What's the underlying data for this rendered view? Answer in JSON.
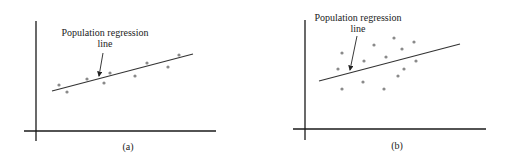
{
  "panels": [
    {
      "id": "a",
      "caption": "(a)",
      "annotation_line1": "Population regression",
      "annotation_line2": "line",
      "description": "Points clustered tightly around regression line"
    },
    {
      "id": "b",
      "caption": "(b)",
      "annotation_line1": "Population regression",
      "annotation_line2": "line",
      "description": "Points widely scattered around regression line"
    }
  ],
  "colors": {
    "axis": "#1a1a1a",
    "line": "#333333",
    "point": "#8a8a8a"
  },
  "chart_data": [
    {
      "type": "scatter",
      "title": "(a)",
      "annotation": "Population regression line",
      "points_px": [
        [
          59,
          85
        ],
        [
          67,
          92
        ],
        [
          87,
          79
        ],
        [
          104,
          83
        ],
        [
          110,
          73
        ],
        [
          135,
          76
        ],
        [
          147,
          63
        ],
        [
          168,
          67
        ],
        [
          179,
          55
        ]
      ],
      "regression_line_px": [
        [
          52,
          91
        ],
        [
          193,
          54
        ]
      ]
    },
    {
      "type": "scatter",
      "title": "(b)",
      "annotation": "Population regression line",
      "points_px": [
        [
          338,
          69
        ],
        [
          342,
          53
        ],
        [
          342,
          89
        ],
        [
          364,
          61
        ],
        [
          363,
          82
        ],
        [
          374,
          45
        ],
        [
          386,
          57
        ],
        [
          384,
          89
        ],
        [
          394,
          38
        ],
        [
          398,
          76
        ],
        [
          402,
          49
        ],
        [
          404,
          69
        ],
        [
          414,
          42
        ],
        [
          416,
          61
        ]
      ],
      "regression_line_px": [
        [
          319,
          81
        ],
        [
          460,
          44
        ]
      ]
    }
  ]
}
